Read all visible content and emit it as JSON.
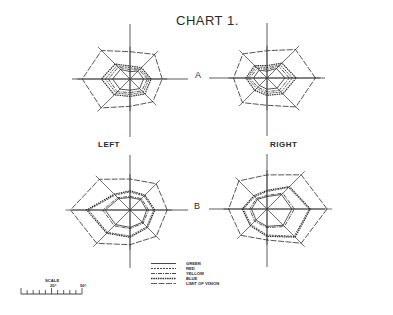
{
  "title": "CHART 1.",
  "row_labels": {
    "a": "A",
    "b": "B"
  },
  "side_labels": {
    "left": "LEFT",
    "right": "RIGHT"
  },
  "legend": [
    {
      "key": "green",
      "label": "GREEN",
      "style": "solid"
    },
    {
      "key": "red",
      "label": "RED",
      "style": "dashed"
    },
    {
      "key": "yellow",
      "label": "YELLOW",
      "style": "dash-dot"
    },
    {
      "key": "blue",
      "label": "BLUE",
      "style": "heavy-dashed"
    },
    {
      "key": "limit",
      "label": "LIMIT OF VISION",
      "style": "long-dash"
    }
  ],
  "scale": {
    "title": "SCALE",
    "mid_label": "20°",
    "end_label": "50°"
  },
  "chart_data": {
    "type": "radar",
    "title": "CHART 1.",
    "meridians_deg": [
      0,
      45,
      90,
      135,
      180,
      225,
      270,
      315
    ],
    "unit": "degrees of visual field",
    "fields": [
      {
        "name": "A-left",
        "row": "A",
        "eye": "LEFT",
        "series": [
          {
            "name": "LIMIT OF VISION",
            "values": [
              52,
              56,
              44,
              65,
              77,
              66,
              44,
              52
            ]
          },
          {
            "name": "BLUE",
            "values": [
              34,
              26,
              21,
              34,
              46,
              36,
              28,
              34
            ]
          },
          {
            "name": "RED",
            "values": [
              31,
              23,
              18,
              30,
              40,
              32,
              25,
              30
            ]
          },
          {
            "name": "YELLOW",
            "values": [
              28,
              21,
              15,
              27,
              35,
              29,
              22,
              27
            ]
          },
          {
            "name": "GREEN",
            "values": [
              22,
              18,
              12,
              22,
              28,
              23,
              18,
              22
            ]
          }
        ]
      },
      {
        "name": "A-right",
        "row": "A",
        "eye": "RIGHT",
        "series": [
          {
            "name": "LIMIT OF VISION",
            "values": [
              78,
              65,
              44,
              55,
              54,
              56,
              44,
              66
            ]
          },
          {
            "name": "BLUE",
            "values": [
              47,
              34,
              20,
              28,
              34,
              28,
              28,
              36
            ]
          },
          {
            "name": "RED",
            "values": [
              41,
              30,
              17,
              25,
              31,
              24,
              25,
              32
            ]
          },
          {
            "name": "YELLOW",
            "values": [
              36,
              27,
              14,
              22,
              28,
              21,
              22,
              28
            ]
          },
          {
            "name": "GREEN",
            "values": [
              29,
              22,
              11,
              18,
              22,
              17,
              18,
              23
            ]
          }
        ]
      },
      {
        "name": "B-left",
        "row": "B",
        "eye": "LEFT",
        "series": [
          {
            "name": "LIMIT OF VISION",
            "values": [
              60,
              60,
              50,
              70,
              96,
              76,
              56,
              60
            ]
          },
          {
            "name": "BLUE",
            "values": [
              40,
              34,
              31,
              36,
              70,
              53,
              44,
              40
            ]
          },
          {
            "name": "RED",
            "values": [
              38,
              32,
              29,
              34,
              67,
              51,
              42,
              38
            ]
          },
          {
            "name": "YELLOW",
            "values": [
              30,
              26,
              22,
              28,
              44,
              36,
              30,
              30
            ]
          },
          {
            "name": "GREEN",
            "values": [
              27,
              24,
              20,
              26,
              40,
              33,
              28,
              28
            ]
          }
        ]
      },
      {
        "name": "B-right",
        "row": "B",
        "eye": "RIGHT",
        "series": [
          {
            "name": "LIMIT OF VISION",
            "values": [
              97,
              78,
              55,
              64,
              62,
              60,
              50,
              78
            ]
          },
          {
            "name": "BLUE",
            "values": [
              70,
              51,
              30,
              30,
              40,
              38,
              44,
              64
            ]
          },
          {
            "name": "RED",
            "values": [
              68,
              49,
              28,
              28,
              38,
              36,
              42,
              62
            ]
          },
          {
            "name": "YELLOW",
            "values": [
              44,
              36,
              22,
              24,
              28,
              28,
              30,
              40
            ]
          },
          {
            "name": "GREEN",
            "values": [
              40,
              33,
              20,
              22,
              25,
              25,
              28,
              37
            ]
          }
        ]
      }
    ],
    "legend_position": "bottom-center",
    "scale_range_deg": [
      0,
      90
    ]
  }
}
